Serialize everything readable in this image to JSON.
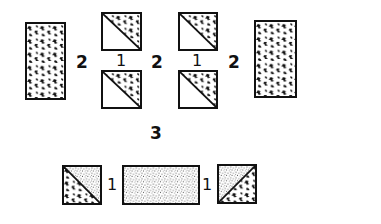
{
  "diagram": {
    "type": "quilt-block-assembly",
    "colors": {
      "ink": "#111111",
      "background": "#ffffff"
    },
    "fabrics": {
      "A": "large-scale print (scattered blotches)",
      "B": "plain/light",
      "C": "fine speckled print"
    },
    "top_row": {
      "pieces": [
        {
          "id": "left-rect",
          "fabric": "A",
          "shape": "rectangle"
        },
        {
          "id": "hst-col1-top",
          "fabric": "A/B",
          "shape": "half-square triangle"
        },
        {
          "id": "hst-col1-bottom",
          "fabric": "A/B",
          "shape": "half-square triangle"
        },
        {
          "id": "hst-col2-top",
          "fabric": "A/B",
          "shape": "half-square triangle"
        },
        {
          "id": "hst-col2-bottom",
          "fabric": "A/B",
          "shape": "half-square triangle"
        },
        {
          "id": "right-rect",
          "fabric": "A",
          "shape": "rectangle"
        }
      ],
      "labels": {
        "seam_left": "2",
        "seam_col1_vertical": "1",
        "seam_middle": "2",
        "seam_col2_vertical": "1",
        "seam_right": "2"
      }
    },
    "step_label": "3",
    "bottom_row": {
      "pieces": [
        {
          "id": "hst-bottom-left",
          "fabric": "A/C",
          "shape": "half-square triangle"
        },
        {
          "id": "center-rect",
          "fabric": "C",
          "shape": "rectangle"
        },
        {
          "id": "hst-bottom-right",
          "fabric": "A/C",
          "shape": "half-square triangle"
        }
      ],
      "labels": {
        "seam_left": "1",
        "seam_right": "1"
      }
    }
  }
}
